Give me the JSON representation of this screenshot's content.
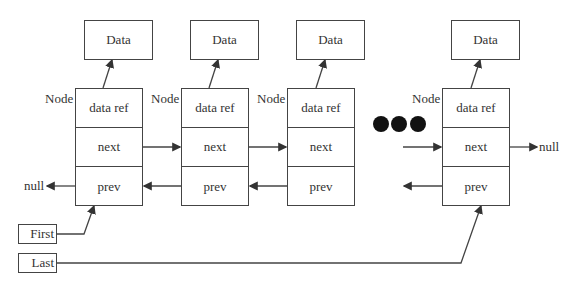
{
  "diagram": {
    "type": "doubly-linked-list",
    "data_boxes": [
      {
        "label": "Data"
      },
      {
        "label": "Data"
      },
      {
        "label": "Data"
      },
      {
        "label": "Data"
      }
    ],
    "nodes": [
      {
        "tag": "Node",
        "fields": [
          "data ref",
          "next",
          "prev"
        ]
      },
      {
        "tag": "Node",
        "fields": [
          "data ref",
          "next",
          "prev"
        ]
      },
      {
        "tag": "Node",
        "fields": [
          "data ref",
          "next",
          "prev"
        ]
      },
      {
        "tag": "Node",
        "fields": [
          "data ref",
          "next",
          "prev"
        ]
      }
    ],
    "null_left": "null",
    "null_right": "null",
    "pointers": {
      "first": "First",
      "last": "Last"
    },
    "ellipsis": "●●●",
    "line_color": "#444444"
  }
}
